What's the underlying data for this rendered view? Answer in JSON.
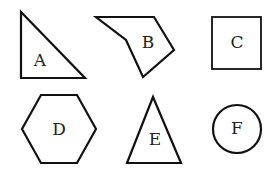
{
  "diagram": {
    "background": "#ffffff",
    "stroke_color": "#111111",
    "shapes": [
      {
        "id": "A",
        "label": "A",
        "type": "right-triangle"
      },
      {
        "id": "B",
        "label": "B",
        "type": "irregular-pentagon"
      },
      {
        "id": "C",
        "label": "C",
        "type": "square"
      },
      {
        "id": "D",
        "label": "D",
        "type": "hexagon"
      },
      {
        "id": "E",
        "label": "E",
        "type": "isosceles-triangle"
      },
      {
        "id": "F",
        "label": "F",
        "type": "circle"
      }
    ]
  }
}
